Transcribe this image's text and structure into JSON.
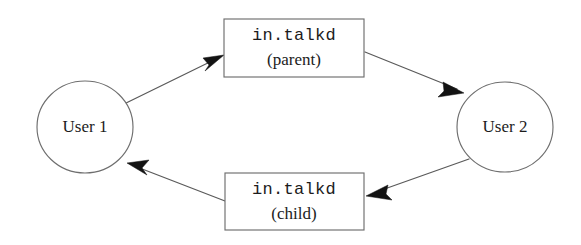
{
  "diagram": {
    "type": "flow-diagram",
    "background_color": "#ffffff",
    "stroke_color": "#6e6e6e",
    "arrow_color": "#131313",
    "text_color": "#1c1c1c",
    "nodes": [
      {
        "id": "user-1",
        "shape": "ellipse",
        "label": "User 1",
        "cx": 85,
        "cy": 127,
        "rx": 48,
        "ry": 46
      },
      {
        "id": "talkd-parent",
        "shape": "rectangle",
        "label_line1": "in.talkd",
        "label_line2": "(parent)",
        "x": 224,
        "y": 19,
        "width": 140,
        "height": 58
      },
      {
        "id": "user-2",
        "shape": "ellipse",
        "label": "User 2",
        "cx": 505,
        "cy": 127,
        "rx": 48,
        "ry": 45
      },
      {
        "id": "talkd-child",
        "shape": "rectangle",
        "label_line1": "in.talkd",
        "label_line2": "(child)",
        "x": 225,
        "y": 173,
        "width": 139,
        "height": 57
      }
    ],
    "edges": [
      {
        "id": "edge-user1-to-parent",
        "from": "user-1",
        "to": "talkd-parent",
        "x1": 122,
        "y1": 105,
        "x2": 222,
        "y2": 56
      },
      {
        "id": "edge-parent-to-user2",
        "from": "talkd-parent",
        "to": "user-2",
        "x1": 365,
        "y1": 52,
        "x2": 464,
        "y2": 93
      },
      {
        "id": "edge-user2-to-child",
        "from": "user-2",
        "to": "talkd-child",
        "x1": 469,
        "y1": 159,
        "x2": 368,
        "y2": 196
      },
      {
        "id": "edge-child-to-user1",
        "from": "talkd-child",
        "to": "user-1",
        "x1": 225,
        "y1": 201,
        "x2": 127,
        "y2": 163
      }
    ]
  }
}
